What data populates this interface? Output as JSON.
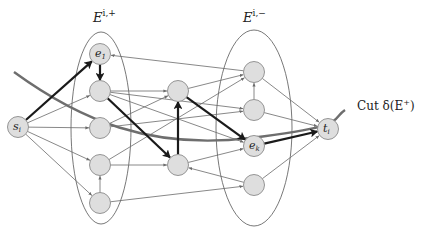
{
  "diagram": {
    "sets": [
      {
        "id": "E_plus",
        "label": "E",
        "sup": "i,+",
        "cx": 101,
        "cy": 128,
        "rx": 30,
        "ry": 96
      },
      {
        "id": "E_minus",
        "label": "E",
        "sup": "i,−",
        "cx": 254,
        "cy": 128,
        "rx": 38,
        "ry": 98
      }
    ],
    "cut": {
      "label": "Cut δ(E",
      "label_sup": "+",
      "label_end": ")"
    },
    "nodes": [
      {
        "id": "s",
        "label": "s",
        "sub": "i",
        "x": 18,
        "y": 127
      },
      {
        "id": "e1",
        "label": "e",
        "sub": "1",
        "x": 100,
        "y": 54
      },
      {
        "id": "L2",
        "label": "",
        "x": 100,
        "y": 91
      },
      {
        "id": "L3",
        "label": "",
        "x": 100,
        "y": 128
      },
      {
        "id": "L4",
        "label": "",
        "x": 100,
        "y": 165
      },
      {
        "id": "L5",
        "label": "",
        "x": 100,
        "y": 203
      },
      {
        "id": "M1",
        "label": "",
        "x": 178,
        "y": 91
      },
      {
        "id": "M2",
        "label": "",
        "x": 178,
        "y": 165
      },
      {
        "id": "R1",
        "label": "",
        "x": 254,
        "y": 72
      },
      {
        "id": "R2",
        "label": "",
        "x": 254,
        "y": 110
      },
      {
        "id": "ek",
        "label": "e",
        "sub": "k",
        "x": 254,
        "y": 146
      },
      {
        "id": "R4",
        "label": "",
        "x": 254,
        "y": 185
      },
      {
        "id": "t",
        "label": "t",
        "sub": "i",
        "x": 328,
        "y": 129
      }
    ],
    "path_edges": [
      [
        "s",
        "e1"
      ],
      [
        "e1",
        "L2"
      ],
      [
        "L2",
        "M2"
      ],
      [
        "M2",
        "M1"
      ],
      [
        "M1",
        "ek"
      ],
      [
        "ek",
        "t"
      ]
    ],
    "edges": [
      [
        "s",
        "L2"
      ],
      [
        "s",
        "L3"
      ],
      [
        "s",
        "L4"
      ],
      [
        "s",
        "L5"
      ],
      [
        "L5",
        "L4"
      ],
      [
        "L2",
        "M1"
      ],
      [
        "L3",
        "M1"
      ],
      [
        "L4",
        "M2"
      ],
      [
        "L3",
        "R2"
      ],
      [
        "L2",
        "ek"
      ],
      [
        "L4",
        "R1"
      ],
      [
        "L5",
        "R4"
      ],
      [
        "L2",
        "R2"
      ],
      [
        "M1",
        "R1"
      ],
      [
        "M2",
        "ek"
      ],
      [
        "R4",
        "M2"
      ],
      [
        "R1",
        "e1"
      ],
      [
        "R2",
        "R1"
      ],
      [
        "R1",
        "t"
      ],
      [
        "R2",
        "t"
      ],
      [
        "R4",
        "t"
      ]
    ]
  }
}
